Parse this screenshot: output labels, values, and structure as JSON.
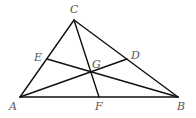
{
  "diagram": {
    "type": "triangle-medians",
    "points": {
      "A": {
        "label": "A",
        "x": 20,
        "y": 97
      },
      "B": {
        "label": "B",
        "x": 178,
        "y": 97
      },
      "C": {
        "label": "C",
        "x": 74,
        "y": 20
      },
      "D": {
        "label": "D",
        "x": 127,
        "y": 59
      },
      "E": {
        "label": "E",
        "x": 47,
        "y": 59
      },
      "F": {
        "label": "F",
        "x": 99,
        "y": 97
      },
      "G": {
        "label": "G",
        "x": 91,
        "y": 72
      }
    },
    "labels": {
      "A": "A",
      "B": "B",
      "C": "C",
      "D": "D",
      "E": "E",
      "F": "F",
      "G": "G"
    },
    "segments": [
      [
        "A",
        "B"
      ],
      [
        "B",
        "C"
      ],
      [
        "C",
        "A"
      ],
      [
        "C",
        "F"
      ],
      [
        "A",
        "D"
      ],
      [
        "B",
        "E"
      ]
    ],
    "colors": {
      "line": "#111111",
      "label": "#555555",
      "background": "#ffffff"
    }
  }
}
